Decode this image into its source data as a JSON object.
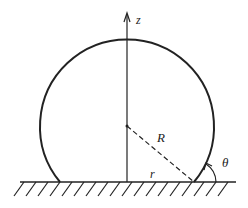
{
  "diagram": {
    "labels": {
      "axis": "z",
      "radius": "R",
      "base_radius": "r",
      "angle": "θ"
    },
    "colors": {
      "stroke": "#222222",
      "background": "#ffffff"
    }
  }
}
